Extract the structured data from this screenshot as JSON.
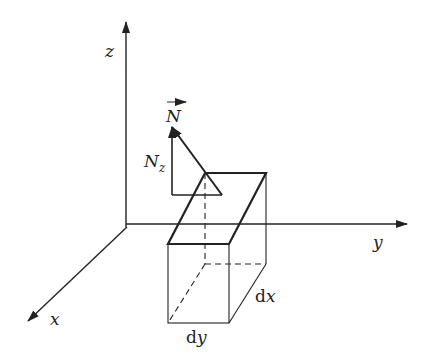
{
  "diagram": {
    "axes": {
      "x_label": "x",
      "y_label": "y",
      "z_label": "z"
    },
    "vector": {
      "label": "N",
      "component_label": "N",
      "component_subscript": "z"
    },
    "element": {
      "dx_prefix": "d",
      "dx_var": "x",
      "dy_prefix": "d",
      "dy_var": "y"
    },
    "colors": {
      "stroke": "#222222",
      "background": "#ffffff"
    }
  }
}
